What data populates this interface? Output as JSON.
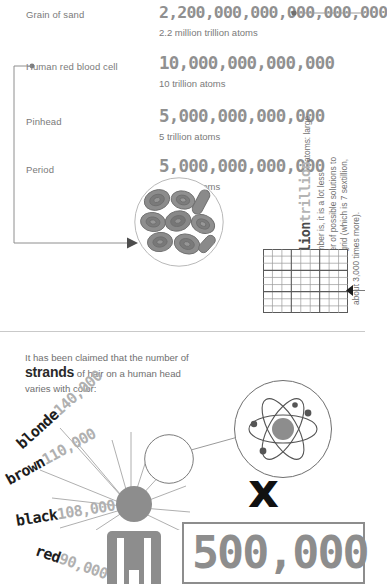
{
  "top_section": {
    "rows": [
      {
        "label": "Grain of sand",
        "number": "2,200,000,000,000,000,000",
        "caption": "2.2 million trillion atoms"
      },
      {
        "label": "Human red blood cell",
        "number": "10,000,000,000,000",
        "caption": "10 trillion atoms"
      },
      {
        "label": "Pinhead",
        "number": "5,000,000,000,000",
        "caption": "5 trillion atoms"
      },
      {
        "label": "Period",
        "number": "5,000,000,000,000",
        "caption": "5 trillion atoms"
      }
    ]
  },
  "side_note": {
    "headline_dark": "2.2 million",
    "headline_light": "trillion",
    "lines": [
      "atoms: large",
      "though this number is, it is a lot less",
      "than the number of possible solutions to",
      "a 9x9 Sudoku grid (which is 7 sextillion,",
      "about 3,000 times more)."
    ]
  },
  "sudoku": {
    "rows": 9,
    "cols": 9,
    "box_size": 3,
    "thin_color": "#9a9a9a",
    "thick_color": "#5a5a5a"
  },
  "hair_section": {
    "claim_line1": "It has been claimed that the number of",
    "claim_strong": "strands",
    "claim_line2_rest": " of hair on a human head",
    "claim_line3": "varies with color:",
    "entries": [
      {
        "color_name": "blonde",
        "count": "140,000",
        "angle": -40
      },
      {
        "color_name": "brown",
        "count": "110,000",
        "angle": -28
      },
      {
        "color_name": "black",
        "count": "108,000",
        "angle": -8
      },
      {
        "color_name": "red",
        "count": "90,000",
        "angle": 20
      }
    ]
  },
  "multiplier": {
    "symbol": "x",
    "value": "500,000"
  },
  "icons": {
    "blood_cells": "blood-cells-icon",
    "atom": "atom-icon",
    "person": "person-icon",
    "magnifier": "magnifier-circle-icon"
  },
  "colors": {
    "text_gray": "#6f6f6f",
    "number_gray": "#909090",
    "dark": "#1d1d1d",
    "light_gray": "#b0b0b0",
    "line_gray": "#8e8e8e"
  }
}
